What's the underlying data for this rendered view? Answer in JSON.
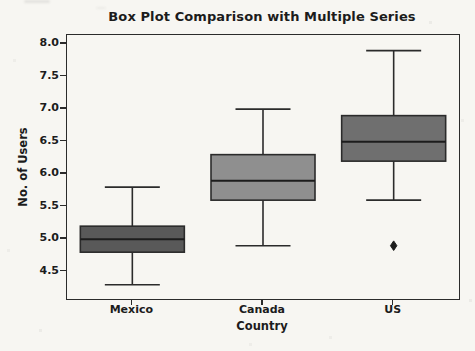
{
  "chart_data": {
    "type": "boxplot",
    "title": "Box Plot Comparison with Multiple Series",
    "xlabel": "Country",
    "ylabel": "No. of Users",
    "categories": [
      "Mexico",
      "Canada",
      "US"
    ],
    "series": [
      {
        "category": "Mexico",
        "min": 4.3,
        "q1": 4.8,
        "median": 5.0,
        "q3": 5.2,
        "max": 5.8,
        "outliers": [],
        "fill_color": "#595959"
      },
      {
        "category": "Canada",
        "min": 4.9,
        "q1": 5.6,
        "median": 5.9,
        "q3": 6.3,
        "max": 7.0,
        "outliers": [],
        "fill_color": "#8f8f8f"
      },
      {
        "category": "US",
        "min": 5.6,
        "q1": 6.2,
        "median": 6.5,
        "q3": 6.9,
        "max": 7.9,
        "outliers": [
          4.9
        ],
        "fill_color": "#6f6f6f"
      }
    ],
    "yticks": [
      4.5,
      5.0,
      5.5,
      6.0,
      6.5,
      7.0,
      7.5,
      8.0
    ],
    "ylim": [
      4.08,
      8.14
    ],
    "grid": false,
    "legend": null,
    "colors": {
      "edge": "#2b2b2b",
      "median": "#1c1c1c",
      "outlier": "#1c1c1c",
      "axis": "#2b2b2b",
      "text": "#1c1c1c",
      "background": "#f7f6f2"
    }
  }
}
